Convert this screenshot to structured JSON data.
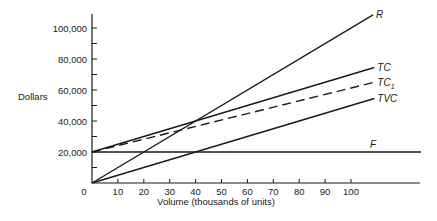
{
  "chart_data": {
    "type": "line",
    "title": "",
    "xlabel": "Volume (thousands of units)",
    "ylabel": "Dollars",
    "xlim": [
      0,
      120
    ],
    "ylim": [
      0,
      110000
    ],
    "x_ticks": [
      0,
      10,
      20,
      30,
      40,
      50,
      60,
      70,
      80,
      90,
      100
    ],
    "x_tick_labels": [
      "0",
      "10",
      "20",
      "30",
      "40",
      "50",
      "60",
      "70",
      "80",
      "90",
      "100"
    ],
    "y_ticks_labeled": [
      20000,
      40000,
      60000,
      80000,
      100000
    ],
    "y_tick_labels": [
      "20,000",
      "40,000",
      "60,000",
      "80,000",
      "100,000"
    ],
    "y_ticks_minor": [
      10000,
      30000,
      50000,
      70000,
      90000
    ],
    "grid": false,
    "series": [
      {
        "name": "R",
        "label_main": "R",
        "label_sub": "",
        "style": "solid",
        "x": [
          0,
          108.5
        ],
        "y": [
          0,
          108500
        ]
      },
      {
        "name": "TC",
        "label_main": "TC",
        "label_sub": "",
        "style": "solid",
        "x": [
          0,
          109
        ],
        "y": [
          20000,
          74500
        ]
      },
      {
        "name": "TC1",
        "label_main": "TC",
        "label_sub": "1",
        "style": "dashed",
        "x": [
          0,
          109
        ],
        "y": [
          20000,
          65000
        ]
      },
      {
        "name": "TVC",
        "label_main": "TVC",
        "label_sub": "",
        "style": "solid",
        "x": [
          0,
          109
        ],
        "y": [
          0,
          54500
        ]
      },
      {
        "name": "F",
        "label_main": "F",
        "label_sub": "",
        "style": "solid",
        "x": [
          0,
          127
        ],
        "y": [
          20000,
          20000
        ]
      }
    ]
  }
}
